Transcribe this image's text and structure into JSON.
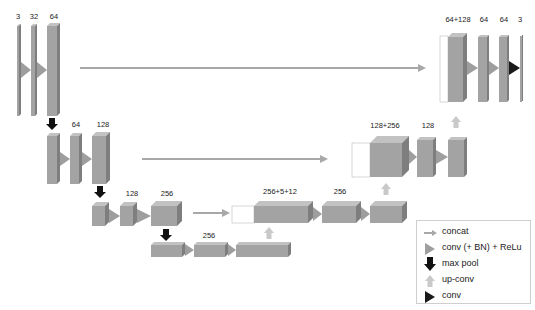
{
  "colors": {
    "block_front": "#a3a3a3",
    "block_top": "#c2c2c2",
    "block_side": "#7e7e7e",
    "conv_relu_arrow": "#9e9e9e",
    "conv_arrow": "#1a1a1a",
    "max_pool_arrow": "#111111",
    "up_conv_arrow": "#c9c9c9",
    "concat_arrow": "#a8a8a8"
  },
  "labels": {
    "enc1": [
      "3",
      "32",
      "64"
    ],
    "enc2": [
      "64",
      "128"
    ],
    "enc3": [
      "128",
      "256"
    ],
    "bottleneck": [
      "256"
    ],
    "dec3": [
      "256+5+12",
      "256"
    ],
    "dec2": [
      "128+256",
      "128"
    ],
    "dec1": [
      "64+128",
      "64",
      "64",
      "3"
    ]
  },
  "legend": {
    "items": [
      {
        "icon": "concat-arrow-icon",
        "label": "concat"
      },
      {
        "icon": "conv-relu-triangle-icon",
        "label": "conv (+ BN) + ReLu"
      },
      {
        "icon": "max-pool-arrow-icon",
        "label": "max pool"
      },
      {
        "icon": "up-conv-arrow-icon",
        "label": "up-conv"
      },
      {
        "icon": "conv-triangle-icon",
        "label": "conv"
      }
    ]
  }
}
